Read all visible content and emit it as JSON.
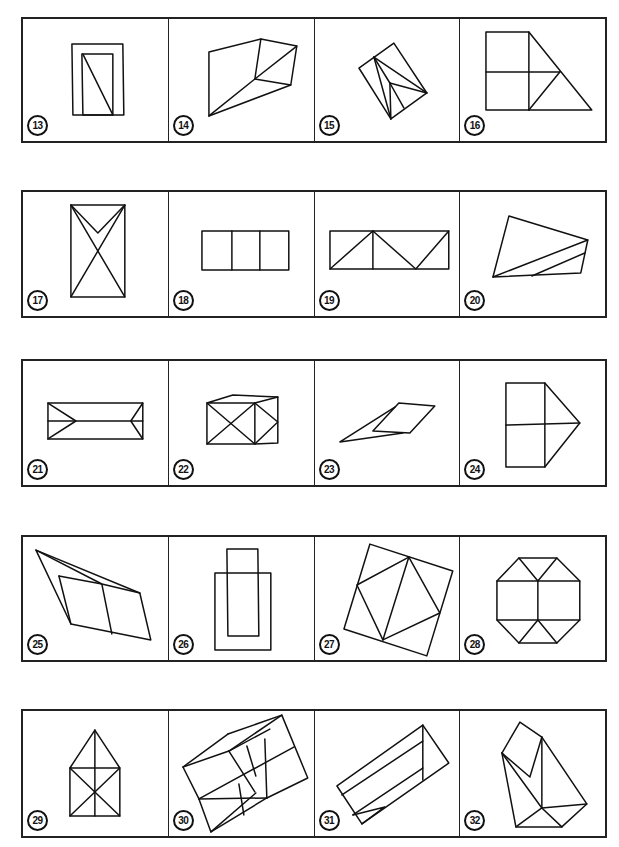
{
  "page": {
    "rows": [
      {
        "panels": [
          {
            "number": "13",
            "shape": "rectangle-in-rectangle-with-diagonal"
          },
          {
            "number": "14",
            "shape": "irregular-polyhedron"
          },
          {
            "number": "15",
            "shape": "tilted-rectangle-with-fan"
          },
          {
            "number": "16",
            "shape": "squares-with-triangle"
          }
        ]
      },
      {
        "panels": [
          {
            "number": "17",
            "shape": "rectangle-with-cross-and-v"
          },
          {
            "number": "18",
            "shape": "three-rectangles"
          },
          {
            "number": "19",
            "shape": "rectangle-with-zigzag"
          },
          {
            "number": "20",
            "shape": "quadrilateral-with-stripes"
          }
        ]
      },
      {
        "panels": [
          {
            "number": "21",
            "shape": "envelope-rectangle"
          },
          {
            "number": "22",
            "shape": "box-with-diagonals"
          },
          {
            "number": "23",
            "shape": "parallelogram-with-spike"
          },
          {
            "number": "24",
            "shape": "house-on-side"
          }
        ]
      },
      {
        "panels": [
          {
            "number": "25",
            "shape": "folded-parallelogram"
          },
          {
            "number": "26",
            "shape": "overlapping-rectangles"
          },
          {
            "number": "27",
            "shape": "square-with-inscribed-square"
          },
          {
            "number": "28",
            "shape": "octagon-with-grid"
          }
        ]
      },
      {
        "panels": [
          {
            "number": "29",
            "shape": "house-with-diagonals"
          },
          {
            "number": "30",
            "shape": "tilted-box-grid"
          },
          {
            "number": "31",
            "shape": "tilted-prism"
          },
          {
            "number": "32",
            "shape": "folded-polyhedron"
          }
        ]
      }
    ]
  }
}
